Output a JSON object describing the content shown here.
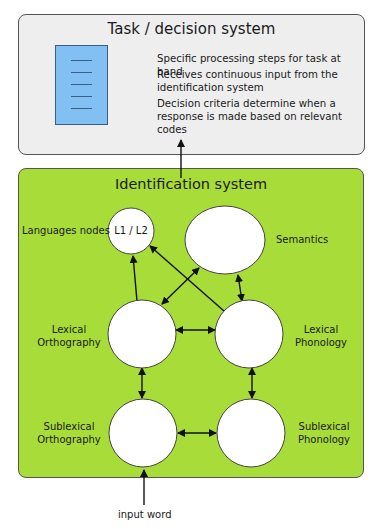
{
  "task_system": {
    "title": "Task / decision system",
    "icon": "document-icon",
    "points": [
      "Specific processing steps for task at hand",
      "Receives continuous input from the",
      "identification system",
      "Decision criteria determine when a",
      "response is made based on relevant codes"
    ],
    "fill": "#eeeeef",
    "doc_fill": "#82c0f4"
  },
  "identification_system": {
    "title": "Identification system",
    "fill": "#a8dc38",
    "nodes": {
      "language": {
        "label": "Languages nodes",
        "inner": "L1 / L2"
      },
      "semantics": {
        "label": "Semantics"
      },
      "lex_orth": {
        "label_1": "Lexical",
        "label_2": "Orthography"
      },
      "lex_phon": {
        "label_1": "Lexical",
        "label_2": "Phonology"
      },
      "sub_orth": {
        "label_1": "Sublexical",
        "label_2": "Orthography"
      },
      "sub_phon": {
        "label_1": "Sublexical",
        "label_2": "Phonology"
      }
    }
  },
  "input": {
    "label": "input word"
  }
}
